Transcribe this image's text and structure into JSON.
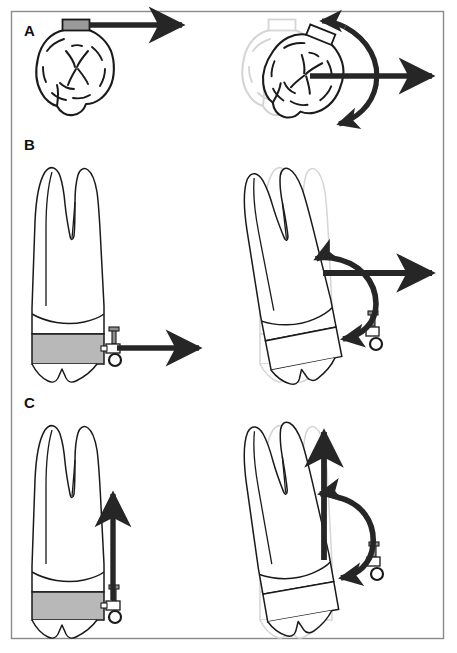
{
  "figure": {
    "background_color": "#ffffff",
    "frame": {
      "name": "figure-border",
      "x": 11,
      "y": 11,
      "width": 433,
      "height": 628,
      "stroke_color": "#8a8a8a",
      "stroke_width": 1.4
    },
    "colors": {
      "outline": "#1a1a1a",
      "ghost_outline": "#d5d5d5",
      "arrow": "#262626",
      "band_gray": "#b8b8b8",
      "attachment_gray": "#9a9a9a",
      "tooth_fill": "#ffffff"
    }
  },
  "panels": [
    {
      "id": "A",
      "label": "A",
      "label_x": 24,
      "label_y": 36,
      "view": "occlusal",
      "description": "Occlusal view of molar. Left: buccal attachment with single straight force arrow producing translation. Right: original position shown as light ghost outline with displaced tooth, straight force arrow plus curved couple arrow producing rotation.",
      "left": {
        "name": "tooth-occlusal-initial",
        "movement": "translation",
        "arrows": [
          {
            "name": "force-arrow-horizontal",
            "type": "straight",
            "direction": "right"
          }
        ],
        "attachment": {
          "name": "buccal-tube-attachment",
          "shape": "rectangle",
          "fill": "#9a9a9a"
        }
      },
      "right": {
        "name": "tooth-occlusal-rotated",
        "movement": "rotation",
        "ghost": {
          "name": "ghost-outline-initial-position",
          "stroke": "#d5d5d5"
        },
        "arrows": [
          {
            "name": "force-arrow-horizontal",
            "type": "straight",
            "direction": "right"
          },
          {
            "name": "couple-arrow-rotational",
            "type": "curved",
            "direction": "counterclockwise"
          }
        ]
      }
    },
    {
      "id": "B",
      "label": "B",
      "label_x": 24,
      "label_y": 150,
      "view": "buccal",
      "description": "Buccal view of maxillary molar with banded crown. Left: horizontal force applied at bracket hook. Right: resulting tipping shown against ghost of original position with straight force arrow and curved couple arrow.",
      "left": {
        "name": "tooth-buccal-initial",
        "movement": "horizontal-force",
        "band": {
          "name": "molar-band",
          "fill": "#b8b8b8"
        },
        "attachment": {
          "name": "bracket-with-hook",
          "parts": [
            "post",
            "slot",
            "eyelet-ring"
          ]
        },
        "arrows": [
          {
            "name": "force-arrow-horizontal",
            "type": "straight",
            "direction": "right"
          }
        ]
      },
      "right": {
        "name": "tooth-buccal-tipped",
        "movement": "tipping",
        "ghost": {
          "name": "ghost-outline-initial-position",
          "stroke": "#d5d5d5"
        },
        "attachment": {
          "name": "bracket-with-hook",
          "parts": [
            "post",
            "slot",
            "eyelet-ring"
          ]
        },
        "arrows": [
          {
            "name": "force-arrow-horizontal",
            "type": "straight",
            "direction": "right"
          },
          {
            "name": "couple-arrow-rotational",
            "type": "curved",
            "direction": "counterclockwise"
          }
        ]
      }
    },
    {
      "id": "C",
      "label": "C",
      "label_x": 24,
      "label_y": 408,
      "view": "buccal",
      "description": "Buccal view of maxillary molar with banded crown. Left: vertical (extrusive) force applied at bracket hook. Right: resulting movement with ghost of original position, vertical force arrow and curved couple arrow.",
      "left": {
        "name": "tooth-buccal-initial",
        "movement": "vertical-force",
        "band": {
          "name": "molar-band",
          "fill": "#b8b8b8"
        },
        "attachment": {
          "name": "bracket-with-hook",
          "parts": [
            "post",
            "slot",
            "eyelet-ring"
          ]
        },
        "arrows": [
          {
            "name": "force-arrow-vertical",
            "type": "straight",
            "direction": "up"
          }
        ]
      },
      "right": {
        "name": "tooth-buccal-displaced",
        "movement": "extrusion-with-rotation",
        "ghost": {
          "name": "ghost-outline-initial-position",
          "stroke": "#d5d5d5"
        },
        "attachment": {
          "name": "bracket-with-hook",
          "parts": [
            "post",
            "slot",
            "eyelet-ring"
          ]
        },
        "arrows": [
          {
            "name": "force-arrow-vertical",
            "type": "straight",
            "direction": "up"
          },
          {
            "name": "couple-arrow-rotational",
            "type": "curved",
            "direction": "counterclockwise"
          }
        ]
      }
    }
  ]
}
